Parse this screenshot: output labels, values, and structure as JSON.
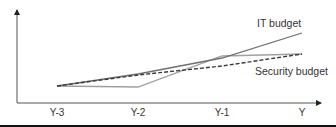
{
  "chart_data": {
    "type": "line",
    "title": "",
    "xlabel": "",
    "ylabel": "",
    "categories": [
      "Y-3",
      "Y-2",
      "Y-1",
      "Y"
    ],
    "series": [
      {
        "name": "IT budget",
        "values": [
          17,
          29,
          45,
          70
        ],
        "style": "solid",
        "color": "#707070"
      },
      {
        "name": "Security budget",
        "values": [
          17,
          28,
          37,
          49
        ],
        "style": "dashed",
        "color": "#3a3a3a"
      },
      {
        "name": "",
        "values": [
          17,
          16,
          47,
          49
        ],
        "style": "solid",
        "color": "#a0a0a0"
      }
    ],
    "annotations": [
      {
        "text": "IT budget",
        "near": "IT budget"
      },
      {
        "text": "Security budget",
        "near": "Security budget"
      }
    ],
    "ylim": [
      0,
      93
    ],
    "grid": false,
    "legend": "inline labels"
  },
  "labels": {
    "it_budget": "IT budget",
    "security_budget": "Security budget",
    "x_ticks": [
      "Y-3",
      "Y-2",
      "Y-1",
      "Y"
    ]
  }
}
